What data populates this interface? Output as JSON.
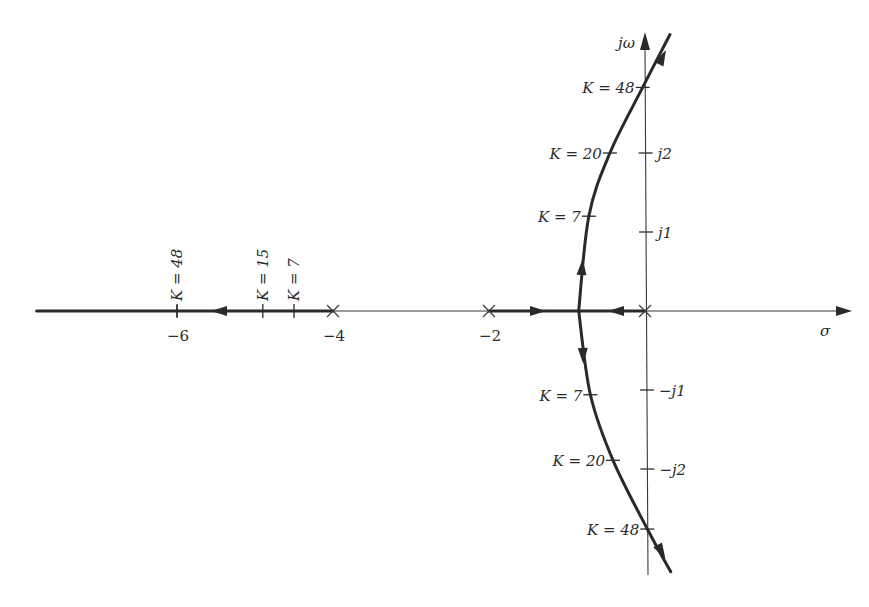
{
  "diagram": {
    "axes": {
      "real_label": "σ",
      "imag_label": "jω",
      "real_ticks": [
        {
          "value": -6,
          "label": "−6"
        },
        {
          "value": -4,
          "label": "−4"
        },
        {
          "value": -2,
          "label": "−2"
        }
      ],
      "imag_ticks": [
        {
          "value": 2,
          "label": "j2"
        },
        {
          "value": 1,
          "label": "j1"
        },
        {
          "value": -1,
          "label": "−j1"
        },
        {
          "value": -2,
          "label": "−j2"
        }
      ]
    },
    "poles": [
      {
        "re": 0,
        "im": 0
      },
      {
        "re": -2,
        "im": 0
      },
      {
        "re": -4,
        "im": 0
      }
    ],
    "breakaway": {
      "re": -0.85,
      "im": 0
    },
    "real_axis_segments": [
      {
        "from": -2,
        "to": 0,
        "direction": "toward-breakaway"
      },
      {
        "from": -4,
        "to": -7.8,
        "direction": "toward-minus-infinity"
      }
    ],
    "complex_branches": [
      {
        "name": "upper",
        "points": [
          [
            -0.85,
            0
          ],
          [
            -0.72,
            1.2
          ],
          [
            -0.45,
            2.0
          ],
          [
            -0.03,
            2.83
          ],
          [
            0.32,
            3.5
          ]
        ]
      },
      {
        "name": "lower",
        "points": [
          [
            -0.85,
            0
          ],
          [
            -0.7,
            -1.06
          ],
          [
            -0.41,
            -1.89
          ],
          [
            0.03,
            -2.76
          ],
          [
            0.33,
            -3.3
          ]
        ]
      }
    ],
    "gain_marks": [
      {
        "branch": "upper",
        "K": 48,
        "label": "K = 48",
        "re": -0.03,
        "im": 2.83
      },
      {
        "branch": "upper",
        "K": 20,
        "label": "K = 20",
        "re": -0.45,
        "im": 2.0
      },
      {
        "branch": "upper",
        "K": 7,
        "label": "K = 7",
        "re": -0.72,
        "im": 1.2
      },
      {
        "branch": "lower",
        "K": 7,
        "label": "K = 7",
        "re": -0.7,
        "im": -1.06
      },
      {
        "branch": "lower",
        "K": 20,
        "label": "K = 20",
        "re": -0.41,
        "im": -1.89
      },
      {
        "branch": "lower",
        "K": 48,
        "label": "K = 48",
        "re": 0.03,
        "im": -2.76
      },
      {
        "branch": "real",
        "K": 48,
        "label": "K = 48",
        "re": -6,
        "im": 0
      },
      {
        "branch": "real",
        "K": 15,
        "label": "K = 15",
        "re": -4.9,
        "im": 0
      },
      {
        "branch": "real",
        "K": 7,
        "label": "K = 7",
        "re": -4.5,
        "im": 0
      }
    ]
  }
}
